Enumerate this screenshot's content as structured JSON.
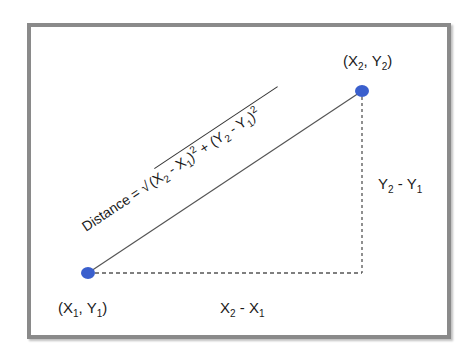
{
  "diagram": {
    "points": [
      {
        "id": "p1",
        "label_x": "X",
        "label_x_sub": "1",
        "label_y": "Y",
        "label_y_sub": "1",
        "cx": 88,
        "cy": 273
      },
      {
        "id": "p2",
        "label_x": "X",
        "label_x_sub": "2",
        "label_y": "Y",
        "label_y_sub": "2",
        "cx": 362,
        "cy": 91
      }
    ],
    "formula": {
      "prefix": "Distance = ",
      "radical": "√",
      "term1": "(X",
      "term1_sub_a": "2",
      "term1_mid": " - X",
      "term1_sub_b": "1",
      "term1_close": ")",
      "term1_exp": "2",
      "plus": " + ",
      "term2": "(Y",
      "term2_sub_a": "2",
      "term2_mid": " - Y",
      "term2_sub_b": "1",
      "term2_close": ")",
      "term2_exp": "2"
    },
    "horizontal_label": {
      "a": "X",
      "a_sub": "2",
      "mid": " - X",
      "b_sub": "1"
    },
    "vertical_label": {
      "a": "Y",
      "a_sub": "2",
      "mid": " - Y",
      "b_sub": "1"
    },
    "colors": {
      "point": "#3a5fcd",
      "line": "#555555",
      "frame": "#8a8a8a",
      "text": "#1a1a1a"
    }
  }
}
